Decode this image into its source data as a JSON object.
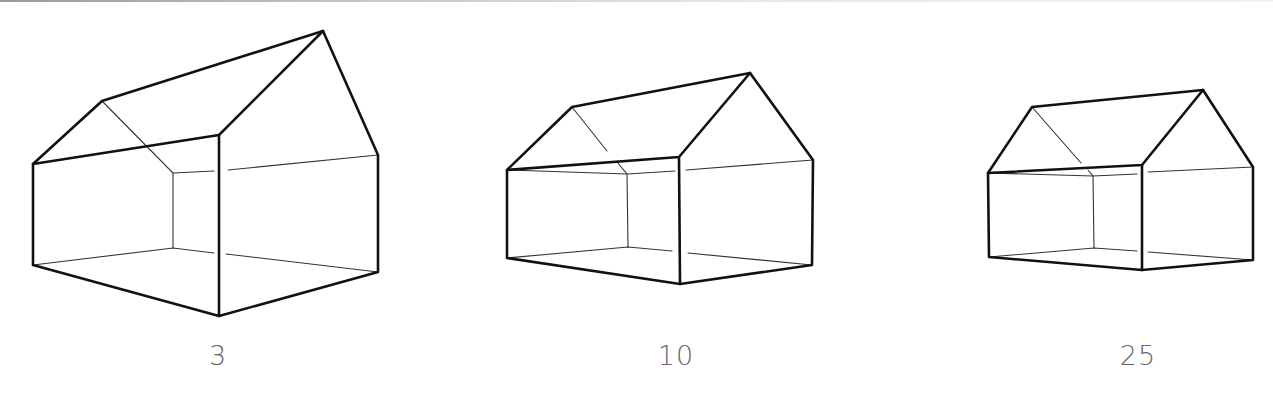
{
  "figure": {
    "type": "perspective-drawing",
    "line_color": "#111111",
    "label_color": "#666666",
    "houses": [
      {
        "label": "3",
        "points": {
          "left_top": [
            33,
            164
          ],
          "left_bottom": [
            33,
            265
          ],
          "front_top": [
            219,
            135
          ],
          "front_bottom": [
            219,
            316
          ],
          "right_top": [
            378,
            155
          ],
          "right_bottom": [
            378,
            272
          ],
          "ridge_back": [
            102,
            101
          ],
          "ridge_front": [
            323,
            31
          ],
          "inner_top": [
            173,
            173
          ],
          "inner_bottom": [
            173,
            248
          ]
        }
      },
      {
        "label": "10",
        "points": {
          "left_top": [
            507,
            170
          ],
          "left_bottom": [
            507,
            258
          ],
          "front_top": [
            679,
            157
          ],
          "front_bottom": [
            680,
            284
          ],
          "right_top": [
            813,
            160
          ],
          "right_bottom": [
            812,
            265
          ],
          "ridge_back": [
            572,
            107
          ],
          "ridge_front": [
            750,
            73
          ],
          "inner_top": [
            627,
            174
          ],
          "inner_bottom": [
            628,
            247
          ]
        }
      },
      {
        "label": "25",
        "points": {
          "left_top": [
            988,
            173
          ],
          "left_bottom": [
            989,
            257
          ],
          "front_top": [
            1142,
            165
          ],
          "front_bottom": [
            1142,
            270
          ],
          "right_top": [
            1253,
            167
          ],
          "right_bottom": [
            1253,
            260
          ],
          "ridge_back": [
            1032,
            107
          ],
          "ridge_front": [
            1203,
            90
          ],
          "inner_top": [
            1093,
            176
          ],
          "inner_bottom": [
            1094,
            248
          ]
        }
      }
    ]
  }
}
